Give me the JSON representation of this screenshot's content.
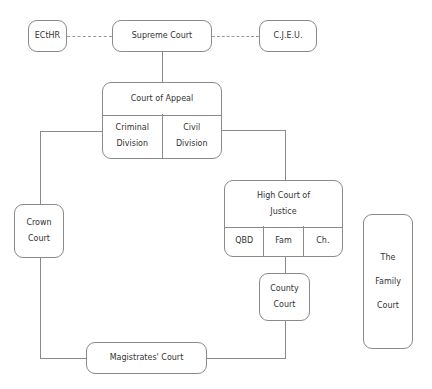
{
  "diagram": {
    "title": "",
    "nodes": {
      "ecthr": {
        "label": "ECtHR"
      },
      "supreme_court": {
        "label": "Supreme Court"
      },
      "cjeu": {
        "label": "C.J.E.U."
      },
      "court_of_appeal": {
        "label": "Court of Appeal",
        "divisions": [
          {
            "line1": "Criminal",
            "line2": "Division"
          },
          {
            "line1": "Civil",
            "line2": "Division"
          }
        ]
      },
      "crown_court": {
        "line1": "Crown",
        "line2": "Court"
      },
      "high_court": {
        "line1": "High Court of",
        "line2": "Justice",
        "divisions": [
          {
            "label": "QBD"
          },
          {
            "label": "Fam"
          },
          {
            "label": "Ch."
          }
        ]
      },
      "county_court": {
        "line1": "County",
        "line2": "Court"
      },
      "magistrates_court": {
        "label": "Magistrates' Court"
      },
      "family_court": {
        "line1": "The",
        "line2": "Family",
        "line3": "Court"
      }
    },
    "edges": [
      {
        "from": "ecthr",
        "to": "supreme_court",
        "style": "dashed"
      },
      {
        "from": "supreme_court",
        "to": "cjeu",
        "style": "dashed"
      },
      {
        "from": "supreme_court",
        "to": "court_of_appeal",
        "style": "solid"
      },
      {
        "from": "court_of_appeal",
        "to": "crown_court",
        "style": "solid"
      },
      {
        "from": "court_of_appeal",
        "to": "high_court",
        "style": "solid"
      },
      {
        "from": "crown_court",
        "to": "magistrates_court",
        "style": "solid"
      },
      {
        "from": "high_court",
        "to": "county_court",
        "style": "solid"
      },
      {
        "from": "county_court",
        "to": "magistrates_court",
        "style": "solid"
      }
    ]
  }
}
